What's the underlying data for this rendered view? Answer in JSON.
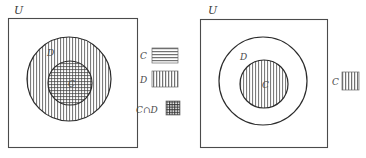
{
  "diagram": {
    "title_hidden": "",
    "colors": {
      "background": "#ffffff",
      "frame_stroke": "#4b4b4b",
      "circle_stroke": "#2b2b2b",
      "hatch_stroke": "#3d3d3d",
      "label_fill": "#4a4a4a"
    },
    "panels": [
      {
        "id": "panel-left",
        "universe_label": "U",
        "caption": "",
        "sets": [
          {
            "name": "D",
            "label": "D",
            "role": "outer-set",
            "fill_pattern": "vertical-lines",
            "cx": 69,
            "cy": 79,
            "r": 42,
            "label_x": 47,
            "label_y": 56
          },
          {
            "name": "C",
            "label": "C",
            "role": "inner-set",
            "fill_pattern": "crosshatch",
            "cx": 70,
            "cy": 83,
            "r": 22,
            "label_x": 68,
            "label_y": 87
          }
        ],
        "legend": [
          {
            "label": "C",
            "pattern": "horizontal-lines"
          },
          {
            "label": "D",
            "pattern": "vertical-lines"
          },
          {
            "label": "C∩D",
            "pattern": "crosshatch"
          }
        ]
      },
      {
        "id": "panel-right",
        "universe_label": "U",
        "caption": "",
        "sets": [
          {
            "name": "D",
            "label": "D",
            "role": "outer-set",
            "fill_pattern": "none",
            "cx": 263,
            "cy": 81,
            "r": 44,
            "label_x": 240,
            "label_y": 60
          },
          {
            "name": "C",
            "label": "C",
            "role": "inner-set",
            "fill_pattern": "vertical-lines",
            "cx": 264,
            "cy": 84,
            "r": 24,
            "label_x": 262,
            "label_y": 88
          }
        ],
        "legend": [
          {
            "label": "C",
            "pattern": "vertical-lines"
          }
        ]
      }
    ]
  }
}
